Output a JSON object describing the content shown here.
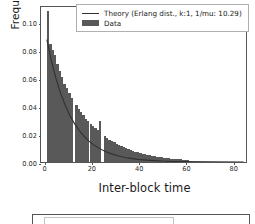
{
  "chart_data": {
    "type": "bar",
    "title": "",
    "xlabel": "Inter-block time",
    "ylabel": "Frequency",
    "xlim": [
      -1.5,
      86
    ],
    "ylim": [
      0.0,
      0.112
    ],
    "xticks": [
      0,
      20,
      40,
      60,
      80
    ],
    "xticklabels": [
      "0",
      "20",
      "40",
      "60",
      "80"
    ],
    "yticks": [
      0.0,
      0.02,
      0.04,
      0.06,
      0.08,
      0.1
    ],
    "yticklabels": [
      "0.00",
      "0.02",
      "0.04",
      "0.06",
      "0.08",
      "0.10"
    ],
    "grid": false,
    "legend_position": "upper right",
    "bar_color": "#595959",
    "line_color": "#303030",
    "bin_width": 1.0,
    "categories": [
      1.5,
      2.5,
      3.5,
      4.5,
      5.5,
      6.5,
      7.5,
      8.5,
      9.5,
      10.5,
      11.5,
      12.5,
      13.5,
      14.5,
      15.5,
      16.5,
      17.5,
      18.5,
      19.5,
      20.5,
      21.5,
      22.5,
      23.5,
      24.5,
      25.5,
      26.5,
      27.5,
      28.5,
      29.5,
      30.5,
      31.5,
      32.5,
      33.5,
      34.5,
      35.5,
      36.5,
      37.5,
      38.5,
      39.5,
      40.5,
      41.5,
      42.5,
      43.5,
      44.5,
      45.5,
      46.5,
      47.5,
      48.5,
      49.5,
      50.5,
      51.5,
      52.5,
      53.5,
      54.5,
      55.5,
      56.5,
      57.5,
      58.5,
      59.5,
      60.5
    ],
    "values": [
      0.108,
      0.084,
      0.08,
      0.076,
      0.07,
      0.065,
      0.061,
      0.056,
      0.053,
      0.0495,
      0.046,
      0.0,
      0.0405,
      0.038,
      0.0355,
      0.0335,
      0.031,
      0.029,
      0.0272,
      0.0255,
      0.024,
      0.0225,
      0.029,
      0.0,
      0.0185,
      0.0172,
      0.016,
      0.015,
      0.014,
      0.013,
      0.0122,
      0.0113,
      0.0105,
      0.0098,
      0.0091,
      0.0085,
      0.0079,
      0.0074,
      0.0069,
      0.0064,
      0.006,
      0.0056,
      0.0052,
      0.0048,
      0.0045,
      0.0042,
      0.0039,
      0.0036,
      0.0034,
      0.0031,
      0.0029,
      0.0027,
      0.0025,
      0.0023,
      0.0022,
      0.002,
      0.0019,
      0.0017,
      0.0016,
      0.0015
    ],
    "series": [
      {
        "name": "Theory (Erlang dist., k:1, 1/mu: 10.29)",
        "type": "line",
        "distribution": "erlang",
        "k": 1,
        "one_over_mu": 10.29,
        "x": [
          1.0,
          3.0,
          5.0,
          7.0,
          9.0,
          11.0,
          13.0,
          15.0,
          17.0,
          19.0,
          21.0,
          23.0,
          25.0,
          27.0,
          29.0,
          31.0,
          33.0,
          35.0,
          37.0,
          39.0,
          41.0,
          45.0,
          50.0,
          55.0,
          60.0,
          70.0,
          85.0
        ],
        "y": [
          0.0884,
          0.0726,
          0.0597,
          0.049,
          0.0403,
          0.0331,
          0.0272,
          0.0224,
          0.0184,
          0.0151,
          0.0124,
          0.0102,
          0.0084,
          0.0069,
          0.0057,
          0.0047,
          0.0038,
          0.0031,
          0.0026,
          0.0021,
          0.0017,
          0.0012,
          0.0007,
          0.0004,
          0.0003,
          0.0001,
          0.0
        ]
      }
    ],
    "legend": [
      {
        "label": "Theory (Erlang dist., k:1, 1/mu: 10.29)",
        "marker": "line",
        "color": "#303030"
      },
      {
        "label": "Data",
        "marker": "patch",
        "color": "#595959"
      }
    ]
  }
}
